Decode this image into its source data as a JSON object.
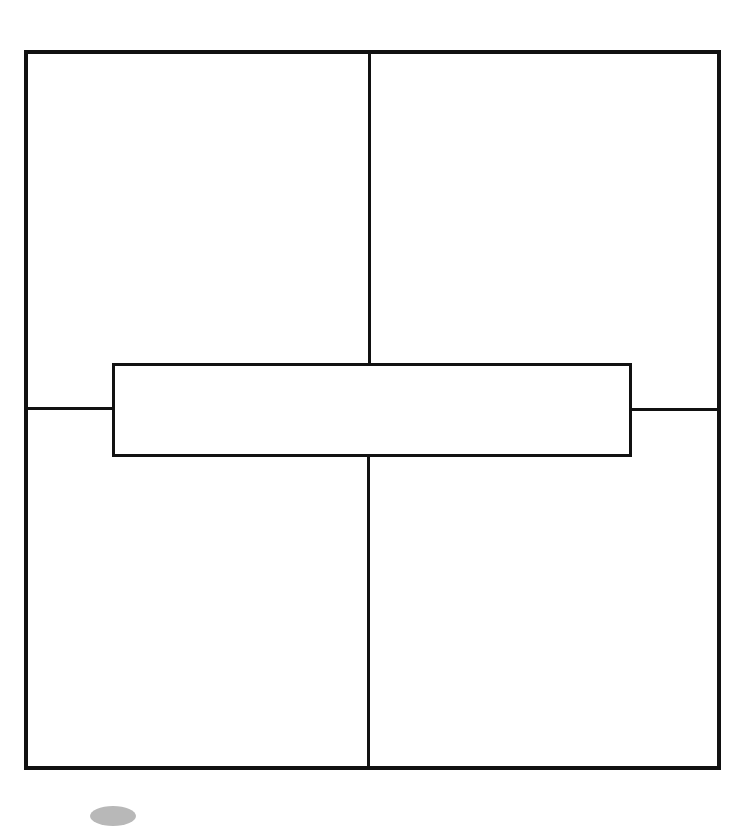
{
  "diagram": {
    "type": "quadrant-template",
    "quadrants": [
      {
        "position": "top-left",
        "label": ""
      },
      {
        "position": "top-right",
        "label": ""
      },
      {
        "position": "bottom-left",
        "label": ""
      },
      {
        "position": "bottom-right",
        "label": ""
      }
    ],
    "center_box": {
      "label": ""
    },
    "colors": {
      "line": "#111111",
      "background": "#ffffff"
    }
  }
}
